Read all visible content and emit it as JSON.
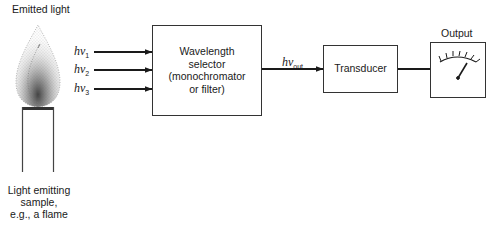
{
  "diagram": {
    "type": "block-diagram",
    "title_label": "Emitted light",
    "source": {
      "label_lines": [
        "Light emitting",
        "sample,",
        "e.g., a flame"
      ],
      "icon": "flame-icon"
    },
    "inputs": [
      {
        "symbol": "hν",
        "subscript": "1"
      },
      {
        "symbol": "hν",
        "subscript": "2"
      },
      {
        "symbol": "hν",
        "subscript": "3"
      }
    ],
    "selector": {
      "label_lines": [
        "Wavelength",
        "selector",
        "(monochromator",
        "or filter)"
      ]
    },
    "selector_output": {
      "symbol": "hν",
      "subscript": "out"
    },
    "transducer": {
      "label": "Transducer"
    },
    "output": {
      "label": "Output",
      "icon": "meter-gauge-icon"
    },
    "flow": [
      "Light emitting sample",
      "Wavelength selector",
      "Transducer",
      "Output"
    ],
    "colors": {
      "line": "#333333",
      "background": "#ffffff"
    }
  }
}
